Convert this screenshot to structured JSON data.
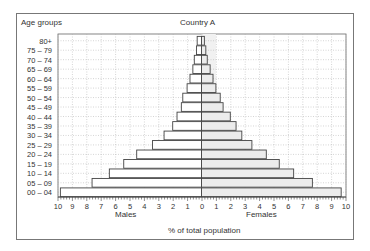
{
  "chart_data": {
    "type": "bar",
    "orientation": "horizontal",
    "subtype": "population-pyramid",
    "title": "Country A",
    "ylabel": "Age groups",
    "xlabel": "% of total population",
    "left_label": "Males",
    "right_label": "Females",
    "xlim": [
      -10,
      10
    ],
    "xticks": [
      10,
      9,
      8,
      7,
      6,
      5,
      4,
      3,
      2,
      1,
      0,
      1,
      2,
      3,
      4,
      5,
      6,
      7,
      8,
      9,
      10
    ],
    "grid": true,
    "categories": [
      "80+",
      "75 – 79",
      "70 – 74",
      "65 – 69",
      "60 – 64",
      "55 – 59",
      "50 – 54",
      "45 – 49",
      "40 – 44",
      "35 – 39",
      "30 – 34",
      "25 – 29",
      "20 – 24",
      "15 – 19",
      "10 – 14",
      "05 – 09",
      "00 – 04"
    ],
    "series": [
      {
        "name": "Males",
        "values": [
          0.3,
          0.35,
          0.5,
          0.6,
          0.8,
          1.0,
          1.3,
          1.4,
          1.7,
          2.0,
          2.6,
          3.4,
          4.5,
          5.4,
          6.4,
          7.6,
          9.8
        ]
      },
      {
        "name": "Females",
        "values": [
          0.2,
          0.3,
          0.4,
          0.6,
          0.8,
          1.0,
          1.3,
          1.5,
          2.0,
          2.4,
          2.8,
          3.5,
          4.5,
          5.4,
          6.4,
          7.7,
          9.7
        ]
      }
    ]
  },
  "colors": {
    "male_fill": "#ffffff",
    "female_fill": "#ececec",
    "bar_stroke": "#444444",
    "grid": "#aaaaaa",
    "frame": "#777777"
  }
}
